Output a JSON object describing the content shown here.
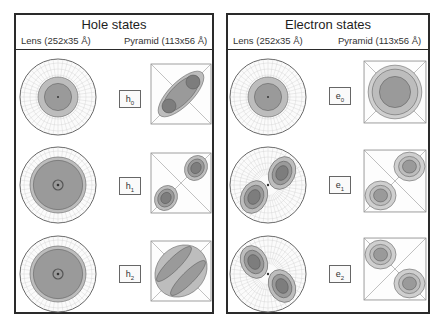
{
  "panels": [
    {
      "title": "Hole states",
      "lens_label": "Lens (252x35 Å)",
      "pyramid_label": "Pyramid (113x56 Å)",
      "states": [
        {
          "symbol": "h",
          "index": "0",
          "lens_shape": "single-center",
          "pyramid_shape": "elongated-diagonal"
        },
        {
          "symbol": "h",
          "index": "1",
          "lens_shape": "ring-center",
          "pyramid_shape": "two-lobes-diagonal"
        },
        {
          "symbol": "h",
          "index": "2",
          "lens_shape": "ring-center",
          "pyramid_shape": "striped-diagonal"
        }
      ]
    },
    {
      "title": "Electron states",
      "lens_label": "Lens (252x35 Å)",
      "pyramid_label": "Pyramid (113x56 Å)",
      "states": [
        {
          "symbol": "e",
          "index": "0",
          "lens_shape": "single-center",
          "pyramid_shape": "single-center"
        },
        {
          "symbol": "e",
          "index": "1",
          "lens_shape": "two-lobes-diagonal",
          "pyramid_shape": "two-lobes-diagonal"
        },
        {
          "symbol": "e",
          "index": "2",
          "lens_shape": "two-lobes-antidiagonal",
          "pyramid_shape": "two-lobes-antidiagonal"
        }
      ]
    }
  ],
  "colors": {
    "outer": "#bdbdbd",
    "mid": "#9a9a9a",
    "inner": "#7d7d7d",
    "grid": "#cfcfcf",
    "edge": "#555555"
  }
}
